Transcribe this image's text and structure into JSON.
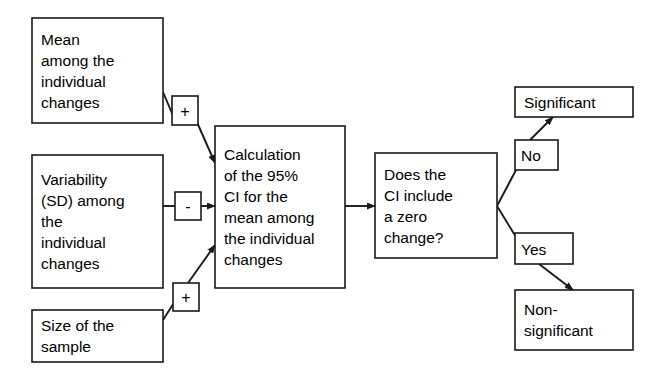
{
  "diagram": {
    "background_color": "#ffffff",
    "stroke_color": "#1a1a1a",
    "text_color": "#000000",
    "nodes": [
      {
        "id": "mean",
        "name": "mean-box",
        "lines": [
          "Mean",
          "among the",
          "individual",
          "changes"
        ],
        "x": 32,
        "y": 18,
        "w": 131,
        "h": 105
      },
      {
        "id": "variability",
        "name": "variability-box",
        "lines": [
          "Variability",
          "(SD) among",
          "the",
          "individual",
          "changes"
        ],
        "x": 32,
        "y": 155,
        "w": 131,
        "h": 133
      },
      {
        "id": "size",
        "name": "sample-size-box",
        "lines": [
          "Size of the",
          "sample"
        ],
        "x": 32,
        "y": 310,
        "w": 131,
        "h": 52
      },
      {
        "id": "calculation",
        "name": "calculation-box",
        "lines": [
          "Calculation",
          "of the 95%",
          "CI for the",
          "mean among",
          "the individual",
          "changes"
        ],
        "x": 215,
        "y": 126,
        "w": 130,
        "h": 162
      },
      {
        "id": "decision",
        "name": "decision-box",
        "lines": [
          "Does the",
          "CI include",
          "a zero",
          "change?"
        ],
        "x": 375,
        "y": 153,
        "w": 122,
        "h": 105
      },
      {
        "id": "significant",
        "name": "significant-outcome-box",
        "lines": [
          "Significant"
        ],
        "x": 515,
        "y": 87,
        "w": 118,
        "h": 30
      },
      {
        "id": "nonsignificant",
        "name": "non-significant-outcome-box",
        "lines": [
          "Non-",
          "significant"
        ],
        "x": 515,
        "y": 290,
        "w": 118,
        "h": 60
      }
    ],
    "operators": [
      {
        "id": "op-plus-top",
        "name": "plus-operator-top",
        "symbol": "+",
        "x": 172,
        "y": 96,
        "w": 26,
        "h": 29
      },
      {
        "id": "op-minus",
        "name": "minus-operator",
        "symbol": "-",
        "x": 175,
        "y": 192,
        "w": 26,
        "h": 28
      },
      {
        "id": "op-plus-bottom",
        "name": "plus-operator-bottom",
        "symbol": "+",
        "x": 173,
        "y": 283,
        "w": 26,
        "h": 28
      }
    ],
    "branch_labels": [
      {
        "id": "no",
        "name": "branch-label-no",
        "text": "No",
        "x": 515,
        "y": 140,
        "w": 43,
        "h": 30
      },
      {
        "id": "yes",
        "name": "branch-label-yes",
        "text": "Yes",
        "x": 515,
        "y": 233,
        "w": 58,
        "h": 31
      }
    ],
    "edges": [
      {
        "id": "mean-to-plus",
        "name": "edge-mean-to-plus",
        "from": "mean",
        "to": "op-plus-top",
        "arrow": false,
        "path": "M163,92 L174,118"
      },
      {
        "id": "plus-to-calc",
        "name": "edge-plus-to-calculation",
        "from": "op-plus-top",
        "to": "calculation",
        "arrow": true,
        "path": "M196,120 L215,163"
      },
      {
        "id": "variability-to-minus",
        "name": "edge-variability-to-minus",
        "from": "variability",
        "to": "op-minus",
        "arrow": false,
        "path": "M163,206 L175,206"
      },
      {
        "id": "minus-to-calc",
        "name": "edge-minus-to-calculation",
        "from": "op-minus",
        "to": "calculation",
        "arrow": true,
        "path": "M201,206 L215,206"
      },
      {
        "id": "size-to-plus",
        "name": "edge-size-to-plus",
        "from": "size",
        "to": "op-plus-bottom",
        "arrow": false,
        "path": "M163,320 L186,284"
      },
      {
        "id": "plus-to-calc2",
        "name": "edge-plus-bottom-to-calculation",
        "from": "op-plus-bottom",
        "to": "calculation",
        "arrow": true,
        "path": "M188,283 L215,245"
      },
      {
        "id": "calc-to-decision",
        "name": "edge-calculation-to-decision",
        "from": "calculation",
        "to": "decision",
        "arrow": true,
        "path": "M345,206 L375,206"
      },
      {
        "id": "decision-to-no",
        "name": "edge-decision-to-no",
        "from": "decision",
        "to": "no",
        "arrow": false,
        "path": "M497,206 L516,170"
      },
      {
        "id": "no-to-significant",
        "name": "edge-no-to-significant",
        "from": "no",
        "to": "significant",
        "arrow": true,
        "path": "M530,140 L553,117"
      },
      {
        "id": "decision-to-yes",
        "name": "edge-decision-to-yes",
        "from": "decision",
        "to": "yes",
        "arrow": false,
        "path": "M497,206 L516,237"
      },
      {
        "id": "yes-to-nonsignificant",
        "name": "edge-yes-to-non-significant",
        "from": "yes",
        "to": "nonsignificant",
        "arrow": true,
        "path": "M539,264 L573,290"
      }
    ]
  }
}
